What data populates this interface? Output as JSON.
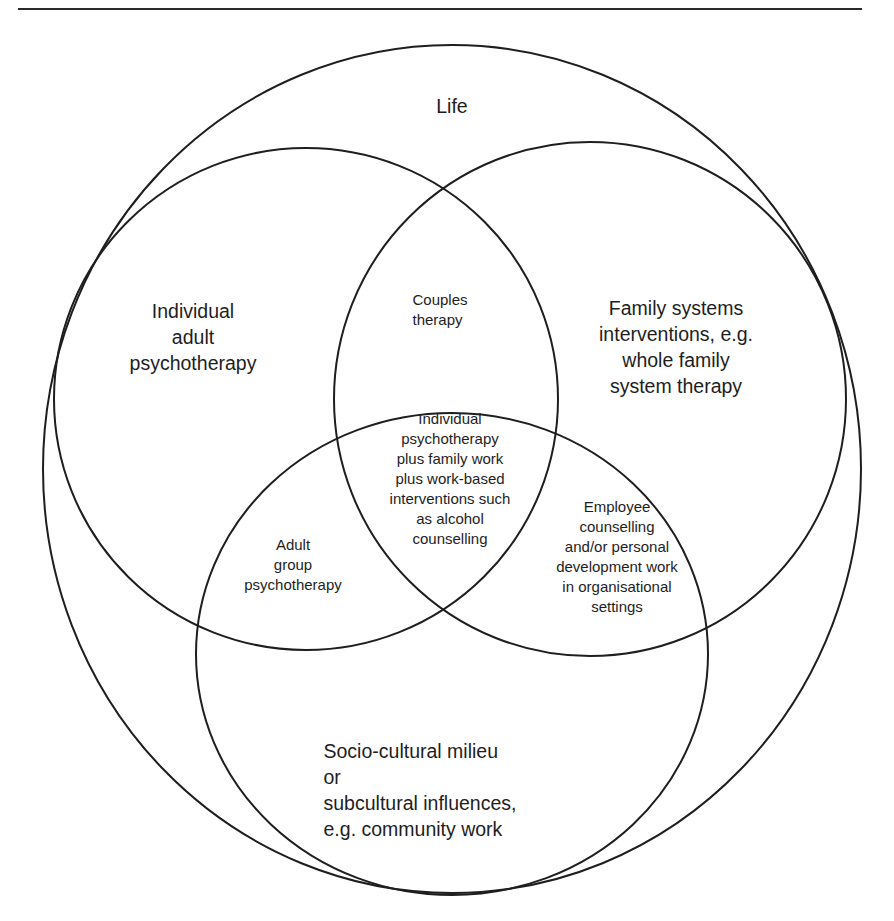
{
  "diagram": {
    "type": "venn",
    "stroke_color": "#1e1e1e",
    "background": "#ffffff",
    "sets": [
      {
        "id": "life",
        "label": "Life"
      },
      {
        "id": "individual",
        "label": "Individual\nadult\npsychotherapy"
      },
      {
        "id": "family",
        "label": "Family systems\ninterventions, e.g.\nwhole family\nsystem therapy"
      },
      {
        "id": "socio",
        "label": "Socio-cultural milieu\n              or\nsubcultural influences,\n  e.g. community work"
      }
    ],
    "intersections": [
      {
        "sets": [
          "individual",
          "family"
        ],
        "label": "Couples\ntherapy"
      },
      {
        "sets": [
          "individual",
          "socio"
        ],
        "label": "Adult\ngroup\npsychotherapy"
      },
      {
        "sets": [
          "family",
          "socio"
        ],
        "label": "Employee\ncounselling\nand/or personal\ndevelopment work\nin organisational\nsettings"
      },
      {
        "sets": [
          "individual",
          "family",
          "socio"
        ],
        "label": "Individual\npsychotherapy\nplus family work\nplus work-based\ninterventions such\nas alcohol\ncounselling"
      }
    ]
  }
}
